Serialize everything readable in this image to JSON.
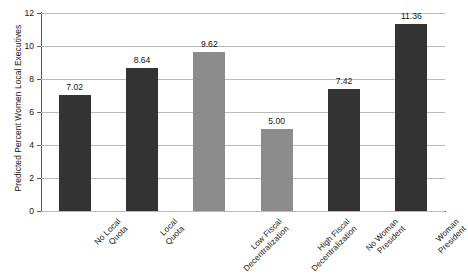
{
  "chart_data": {
    "type": "bar",
    "title": "",
    "xlabel": "",
    "ylabel": "Predicted Percent Women Local Executives",
    "ylim": [
      0,
      12
    ],
    "ytick_step": 2,
    "yticks": [
      "12",
      "10",
      "8",
      "6",
      "4",
      "2",
      "0"
    ],
    "grid": true,
    "legend": "none",
    "categories": [
      "No Local Quota",
      "Local Quota",
      "Low Fiscal Decentralization",
      "High Fiscal Decentralization",
      "No Woman President",
      "Woman President"
    ],
    "category_lines": [
      [
        "No Local",
        "Quota"
      ],
      [
        "Local",
        "Quota"
      ],
      [
        "Low Fiscal",
        "Decentralization"
      ],
      [
        "High Fiscal",
        "Decentralization"
      ],
      [
        "No Woman",
        "President"
      ],
      [
        "Woman",
        "President"
      ]
    ],
    "values": [
      7.02,
      8.64,
      9.62,
      5.0,
      7.42,
      11.36
    ],
    "value_labels": [
      "7.02",
      "8.64",
      "9.62",
      "5.00",
      "7.42",
      "11.36"
    ],
    "bar_colors": [
      "#333333",
      "#333333",
      "#8c8c8c",
      "#8c8c8c",
      "#333333",
      "#333333"
    ],
    "colors": {
      "dark_bar": "#333333",
      "light_bar": "#8c8c8c",
      "gridline": "#b9b9b9",
      "axis": "#5a5a5a",
      "text": "#141414",
      "background": "#ffffff"
    }
  }
}
